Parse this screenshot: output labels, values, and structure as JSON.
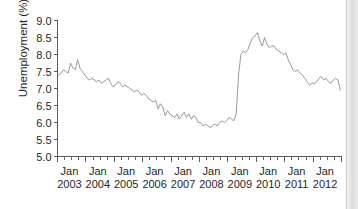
{
  "chart_data": {
    "type": "line",
    "title": "",
    "subtitle": "",
    "xlabel": "",
    "ylabel": "Unemployment (%)",
    "ylim": [
      5.0,
      9.0
    ],
    "ytick_labels": [
      "9.0",
      "8.5",
      "8.0",
      "7.5",
      "7.0",
      "6.5",
      "6.0",
      "5.5",
      "5.0"
    ],
    "ytick_values": [
      9.0,
      8.5,
      8.0,
      7.5,
      7.0,
      6.5,
      6.0,
      5.5,
      5.0
    ],
    "xtick_month_labels": [
      "Jan",
      "Jan",
      "Jan",
      "Jan",
      "Jan",
      "Jan",
      "Jan",
      "Jan",
      "Jan",
      "Jan"
    ],
    "xtick_year_labels": [
      "2003",
      "2004",
      "2005",
      "2006",
      "2007",
      "2008",
      "2009",
      "2010",
      "2011",
      "2012"
    ],
    "xlim": [
      "2003-01",
      "2012-12"
    ],
    "x_minor_ticks_per_year": 4,
    "grid": false,
    "legend": "none",
    "line_color": "#8c8c8c",
    "series": [
      {
        "name": "Unemployment rate",
        "x": [
          "2003-01",
          "2003-02",
          "2003-03",
          "2003-04",
          "2003-05",
          "2003-06",
          "2003-07",
          "2003-08",
          "2003-09",
          "2003-10",
          "2003-11",
          "2003-12",
          "2004-01",
          "2004-02",
          "2004-03",
          "2004-04",
          "2004-05",
          "2004-06",
          "2004-07",
          "2004-08",
          "2004-09",
          "2004-10",
          "2004-11",
          "2004-12",
          "2005-01",
          "2005-02",
          "2005-03",
          "2005-04",
          "2005-05",
          "2005-06",
          "2005-07",
          "2005-08",
          "2005-09",
          "2005-10",
          "2005-11",
          "2005-12",
          "2006-01",
          "2006-02",
          "2006-03",
          "2006-04",
          "2006-05",
          "2006-06",
          "2006-07",
          "2006-08",
          "2006-09",
          "2006-10",
          "2006-11",
          "2006-12",
          "2007-01",
          "2007-02",
          "2007-03",
          "2007-04",
          "2007-05",
          "2007-06",
          "2007-07",
          "2007-08",
          "2007-09",
          "2007-10",
          "2007-11",
          "2007-12",
          "2008-01",
          "2008-02",
          "2008-03",
          "2008-04",
          "2008-05",
          "2008-06",
          "2008-07",
          "2008-08",
          "2008-09",
          "2008-10",
          "2008-11",
          "2008-12",
          "2009-01",
          "2009-02",
          "2009-03",
          "2009-04",
          "2009-05",
          "2009-06",
          "2009-07",
          "2009-08",
          "2009-09",
          "2009-10",
          "2009-11",
          "2009-12",
          "2010-01",
          "2010-02",
          "2010-03",
          "2010-04",
          "2010-05",
          "2010-06",
          "2010-07",
          "2010-08",
          "2010-09",
          "2010-10",
          "2010-11",
          "2010-12",
          "2011-01",
          "2011-02",
          "2011-03",
          "2011-04",
          "2011-05",
          "2011-06",
          "2011-07",
          "2011-08",
          "2011-09",
          "2011-10",
          "2011-11",
          "2011-12",
          "2012-01",
          "2012-02",
          "2012-03",
          "2012-04",
          "2012-05",
          "2012-06",
          "2012-07",
          "2012-08",
          "2012-09",
          "2012-10",
          "2012-11",
          "2012-12"
        ],
        "values": [
          7.4,
          7.45,
          7.55,
          7.5,
          7.45,
          7.75,
          7.6,
          7.55,
          7.85,
          7.6,
          7.5,
          7.4,
          7.3,
          7.25,
          7.3,
          7.25,
          7.2,
          7.25,
          7.15,
          7.2,
          7.25,
          7.3,
          7.15,
          7.05,
          7.1,
          7.2,
          7.15,
          7.05,
          7.1,
          7.05,
          7.0,
          6.95,
          6.9,
          6.95,
          6.9,
          6.8,
          6.85,
          6.8,
          6.7,
          6.65,
          6.6,
          6.65,
          6.4,
          6.55,
          6.45,
          6.2,
          6.35,
          6.25,
          6.2,
          6.15,
          6.25,
          6.1,
          6.2,
          6.3,
          6.15,
          6.25,
          6.1,
          6.2,
          6.15,
          6.0,
          6.0,
          5.9,
          5.95,
          5.9,
          5.85,
          5.9,
          5.95,
          5.9,
          6.0,
          6.05,
          6.0,
          6.05,
          6.15,
          6.1,
          6.05,
          6.25,
          7.4,
          8.0,
          8.1,
          8.05,
          8.15,
          8.35,
          8.5,
          8.55,
          8.65,
          8.4,
          8.25,
          8.5,
          8.3,
          8.2,
          8.25,
          8.25,
          8.15,
          8.1,
          8.05,
          8.0,
          8.05,
          7.85,
          7.7,
          7.55,
          7.5,
          7.55,
          7.45,
          7.4,
          7.3,
          7.2,
          7.1,
          7.15,
          7.15,
          7.2,
          7.3,
          7.35,
          7.25,
          7.3,
          7.2,
          7.15,
          7.25,
          7.3,
          7.25,
          6.95
        ]
      }
    ]
  }
}
